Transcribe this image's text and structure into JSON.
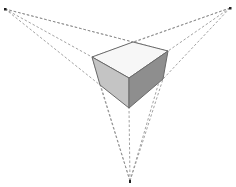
{
  "diagram": {
    "type": "three-point-perspective",
    "colors": {
      "background": "#ffffff",
      "top_face": "#f7f7f7",
      "left_face": "#c4c4c4",
      "right_face": "#8e8e8e",
      "edge": "#6a6a6a",
      "guide": "#8a8a8a",
      "vanishing_point": "#222222"
    },
    "vanishing_points": {
      "left": [
        5,
        9
      ],
      "right": [
        230,
        8
      ],
      "bottom": [
        130,
        181
      ]
    },
    "cube": {
      "top_left": [
        92,
        57
      ],
      "top_back": [
        133,
        42
      ],
      "top_right": [
        168,
        51
      ],
      "top_front": [
        129,
        78
      ],
      "bottom_left": [
        100,
        85
      ],
      "bottom_front": [
        129,
        108
      ],
      "bottom_right": [
        163,
        79
      ]
    }
  }
}
